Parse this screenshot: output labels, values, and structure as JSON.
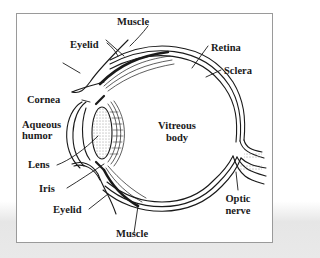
{
  "diagram": {
    "type": "anatomy",
    "labels": {
      "muscle_top": "Muscle",
      "eyelid_top": "Eyelid",
      "retina": "Retina",
      "sclera": "Sclera",
      "cornea": "Cornea",
      "aqueous_line1": "Aqueous",
      "aqueous_line2": "humor",
      "vitreous_line1": "Vitreous",
      "vitreous_line2": "body",
      "lens": "Lens",
      "iris": "Iris",
      "eyelid_bottom": "Eyelid",
      "optic_line1": "Optic",
      "optic_line2": "nerve",
      "muscle_bottom": "Muscle"
    },
    "colors": {
      "ink": "#1a1a1a",
      "frame": "#9a9a9a",
      "background": "#ffffff"
    }
  }
}
